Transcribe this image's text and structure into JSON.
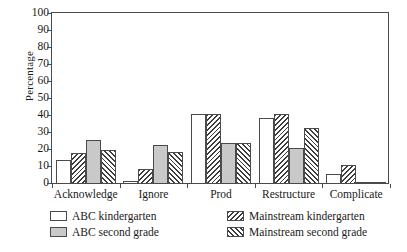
{
  "chart_data": {
    "type": "bar",
    "title": "",
    "xlabel": "",
    "ylabel": "Percentage",
    "ylim": [
      0,
      100
    ],
    "ytick_step": 10,
    "yticks": [
      0,
      10,
      20,
      30,
      40,
      50,
      60,
      70,
      80,
      90,
      100
    ],
    "grid": false,
    "legend_position": "below-axes",
    "categories": [
      "Acknowledge",
      "Ignore",
      "Prod",
      "Restructure",
      "Complicate"
    ],
    "series": [
      {
        "name": "ABC kindergarten",
        "fill": "white",
        "color": "#ffffff",
        "values": [
          14,
          2,
          41,
          39,
          6
        ]
      },
      {
        "name": "Mainstream kindergarten",
        "fill": "hatch-backslash",
        "color": "#3d3d3d",
        "values": [
          18,
          9,
          41,
          41,
          11
        ]
      },
      {
        "name": "ABC second grade",
        "fill": "gray",
        "color": "#c9c9c9",
        "values": [
          26,
          23,
          24,
          21,
          1
        ]
      },
      {
        "name": "Mainstream second grade",
        "fill": "hatch-forwardslash",
        "color": "#3d3d3d",
        "values": [
          20,
          19,
          24,
          33,
          1
        ]
      }
    ]
  },
  "axes": {
    "y_title": "Percentage",
    "y_tick_labels": [
      "100",
      "90",
      "80",
      "70",
      "60",
      "50",
      "40",
      "30",
      "20",
      "10",
      "0"
    ],
    "x_tick_labels": [
      "Acknowledge",
      "Ignore",
      "Prod",
      "Restructure",
      "Complicate"
    ]
  },
  "legend": {
    "entries": [
      {
        "label": "ABC kindergarten",
        "swatch": "white-swatch"
      },
      {
        "label": "ABC second grade",
        "swatch": "gray-swatch"
      },
      {
        "label": "Mainstream kindergarten",
        "swatch": "hatch-backslash-swatch"
      },
      {
        "label": "Mainstream second grade",
        "swatch": "hatch-forwardslash-swatch"
      }
    ]
  },
  "colors": {
    "axis": "#4a4a4a",
    "text": "#1a1a1a",
    "gray_fill": "#c9c9c9",
    "hatch": "#3d3d3d",
    "background": "#ffffff"
  }
}
